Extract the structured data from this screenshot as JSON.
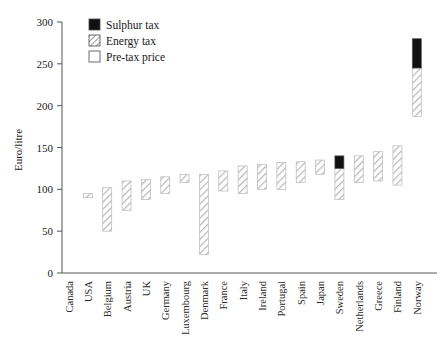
{
  "chart_data": {
    "type": "bar",
    "title": "",
    "subtitle": "",
    "xlabel": "",
    "ylabel": "Euro/litre",
    "ylim": [
      0,
      300
    ],
    "yticks": [
      0,
      50,
      100,
      150,
      200,
      250,
      300
    ],
    "ytick_labels": [
      "0",
      "50",
      "100",
      "150",
      "200",
      "250",
      "300"
    ],
    "grid": false,
    "legend_position": "top-left",
    "categories": [
      "Canada",
      "USA",
      "Belgium",
      "Austria",
      "UK",
      "Germany",
      "Luxembourg",
      "Denmark",
      "France",
      "Italy",
      "Ireland",
      "Portugal",
      "Spain",
      "Japan",
      "Sweden",
      "Netherlands",
      "Greece",
      "Finland",
      "Norway"
    ],
    "series": [
      {
        "name": "Sulphur tax",
        "fill": "solid-black",
        "color": "#111111",
        "values": [
          0,
          0,
          0,
          0,
          0,
          0,
          0,
          0,
          0,
          0,
          0,
          0,
          0,
          0,
          15,
          0,
          0,
          0,
          35
        ]
      },
      {
        "name": "Energy tax",
        "fill": "diagonal-hatch",
        "color": "#c9c9c9",
        "tops": [
          0,
          95,
          102,
          110,
          112,
          115,
          118,
          118,
          122,
          128,
          130,
          132,
          133,
          135,
          125,
          140,
          145,
          152,
          245
        ],
        "bottoms": [
          0,
          90,
          50,
          75,
          88,
          95,
          108,
          22,
          98,
          95,
          100,
          100,
          108,
          118,
          88,
          108,
          110,
          105,
          187
        ]
      },
      {
        "name": "Pre-tax price",
        "fill": "white-open",
        "color": "#ffffff",
        "values": [
          0,
          90,
          50,
          75,
          88,
          95,
          108,
          22,
          98,
          95,
          100,
          100,
          108,
          118,
          88,
          108,
          110,
          105,
          187
        ]
      }
    ],
    "legend_entries": [
      "Sulphur tax",
      "Energy tax",
      "Pre-tax price"
    ]
  },
  "axis": {
    "y_title": "Euro/litre"
  }
}
